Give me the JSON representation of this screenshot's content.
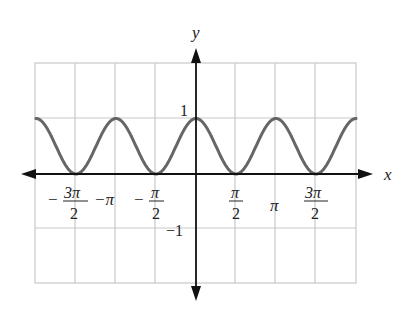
{
  "chart_data": {
    "type": "line",
    "title": "",
    "function": "y = cos^2(x)",
    "xlabel": "x",
    "ylabel": "y",
    "xlim": [
      -6.2832,
      6.2832
    ],
    "ylim": [
      -2,
      2
    ],
    "grid": true,
    "x_ticks": [
      {
        "value": -4.7124,
        "label_num": "3π",
        "label_den": "2",
        "sign": "−"
      },
      {
        "value": -3.1416,
        "label": "−π"
      },
      {
        "value": -1.5708,
        "label_num": "π",
        "label_den": "2",
        "sign": "−"
      },
      {
        "value": 1.5708,
        "label_num": "π",
        "label_den": "2",
        "sign": ""
      },
      {
        "value": 3.1416,
        "label": "π"
      },
      {
        "value": 4.7124,
        "label_num": "3π",
        "label_den": "2",
        "sign": ""
      }
    ],
    "y_ticks": [
      {
        "value": 1,
        "label": "1"
      },
      {
        "value": -1,
        "label": "−1"
      }
    ],
    "series": [
      {
        "name": "cos²x",
        "color": "#666666",
        "x": [
          -6.2832,
          -4.7124,
          -3.1416,
          -1.5708,
          0,
          1.5708,
          3.1416,
          4.7124,
          6.2832
        ],
        "values": [
          1,
          0,
          1,
          0,
          1,
          0,
          1,
          0,
          1
        ]
      }
    ]
  },
  "labels": {
    "x_axis": "x",
    "y_axis": "y",
    "y_one": "1",
    "y_neg_one": "−1",
    "neg": "−",
    "three_pi": "3π",
    "pi": "π",
    "two": "2",
    "neg_pi": "−π"
  }
}
